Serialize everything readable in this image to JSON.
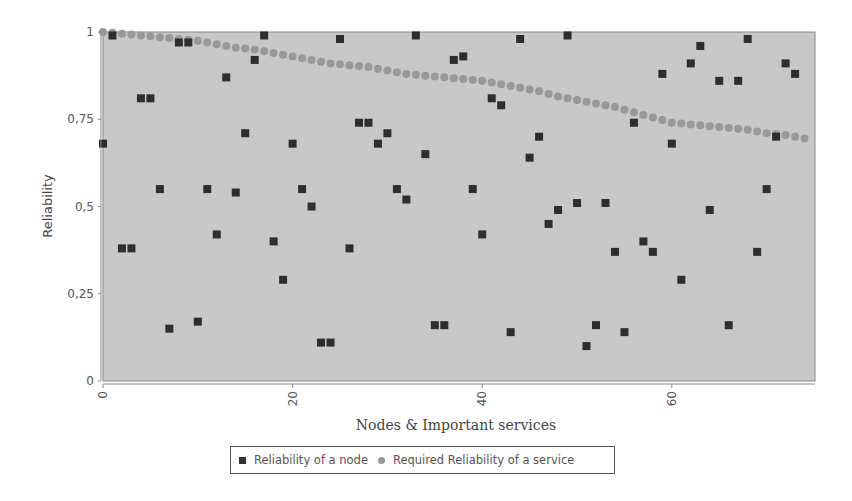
{
  "chart_data": {
    "type": "scatter",
    "title": "",
    "xlabel": "Nodes & Important services",
    "ylabel": "Reliability",
    "xlim": [
      0,
      75
    ],
    "ylim": [
      0,
      1
    ],
    "x_ticks": [
      "0",
      "20",
      "40",
      "60"
    ],
    "y_ticks": [
      "0",
      "0,25",
      "0,5",
      "0,75",
      "1"
    ],
    "grid": false,
    "legend_position": "bottom",
    "series": [
      {
        "name": "Reliability of a node",
        "marker": "square",
        "color": "#2e2e2e",
        "x": [
          0,
          1,
          2,
          3,
          4,
          5,
          6,
          7,
          8,
          9,
          10,
          11,
          12,
          13,
          14,
          15,
          16,
          17,
          18,
          19,
          20,
          21,
          22,
          23,
          24,
          25,
          26,
          27,
          28,
          29,
          30,
          31,
          32,
          33,
          34,
          35,
          36,
          37,
          38,
          39,
          40,
          41,
          42,
          43,
          44,
          45,
          46,
          47,
          48,
          49,
          50,
          51,
          52,
          53,
          54,
          55,
          56,
          57,
          58,
          59,
          60,
          61,
          62,
          63,
          64,
          65,
          66,
          67,
          68,
          69,
          70,
          71,
          72,
          73
        ],
        "values": [
          0.68,
          0.99,
          0.38,
          0.38,
          0.81,
          0.81,
          0.55,
          0.15,
          0.97,
          0.97,
          0.17,
          0.55,
          0.42,
          0.87,
          0.54,
          0.71,
          0.92,
          0.99,
          0.4,
          0.29,
          0.68,
          0.55,
          0.5,
          0.11,
          0.11,
          0.98,
          0.38,
          0.74,
          0.74,
          0.68,
          0.71,
          0.55,
          0.52,
          0.99,
          0.65,
          0.16,
          0.16,
          0.92,
          0.93,
          0.55,
          0.42,
          0.81,
          0.79,
          0.14,
          0.98,
          0.64,
          0.7,
          0.45,
          0.49,
          0.99,
          0.51,
          0.1,
          0.16,
          0.51,
          0.37,
          0.14,
          0.74,
          0.4,
          0.37,
          0.88,
          0.68,
          0.29,
          0.91,
          0.96,
          0.49,
          0.86,
          0.16,
          0.86,
          0.98,
          0.37,
          0.55,
          0.7,
          0.91,
          0.88
        ]
      },
      {
        "name": "Required Reliability of a service",
        "marker": "circle",
        "color": "#999999",
        "x": [
          0,
          2,
          4,
          6,
          8,
          10,
          12,
          14,
          16,
          18,
          20,
          22,
          24,
          26,
          28,
          30,
          32,
          34,
          36,
          38,
          40,
          42,
          44,
          46,
          48,
          50,
          52,
          54,
          56,
          58,
          60,
          62,
          64,
          66,
          68,
          70,
          72,
          74
        ],
        "values": [
          1.0,
          0.995,
          0.99,
          0.985,
          0.98,
          0.975,
          0.965,
          0.955,
          0.95,
          0.94,
          0.93,
          0.92,
          0.91,
          0.905,
          0.9,
          0.89,
          0.88,
          0.875,
          0.87,
          0.865,
          0.86,
          0.85,
          0.84,
          0.83,
          0.815,
          0.805,
          0.795,
          0.785,
          0.77,
          0.755,
          0.74,
          0.735,
          0.73,
          0.725,
          0.72,
          0.71,
          0.705,
          0.695
        ]
      }
    ]
  },
  "legend": {
    "items": [
      "Reliability of a node",
      "Required Reliability of a service"
    ]
  }
}
